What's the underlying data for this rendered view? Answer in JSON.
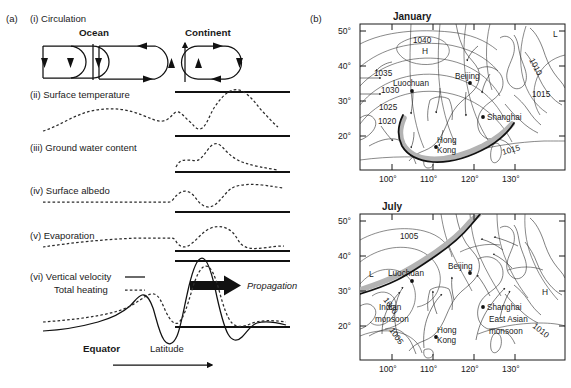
{
  "figure": {
    "panel_a_tag": "(a)",
    "panel_b_tag": "(b)"
  },
  "panel_a": {
    "rows": [
      {
        "id": "i",
        "label": "(i) Circulation"
      },
      {
        "id": "ii",
        "label": "(ii) Surface temperature"
      },
      {
        "id": "iii",
        "label": "(iii) Ground water content"
      },
      {
        "id": "iv",
        "label": "(iv) Surface albedo"
      },
      {
        "id": "v",
        "label": "(v) Evaporation"
      },
      {
        "id": "vi",
        "label": "(vi) Vertical velocity"
      },
      {
        "id": "vi_b",
        "label": "Total heating"
      }
    ],
    "circulation": {
      "ocean_label": "Ocean",
      "continent_label": "Continent"
    },
    "annotations": {
      "propagation": "Propagation",
      "equator": "Equator",
      "latitude": "Latitude"
    },
    "legend": {
      "vertical_velocity_style": "solid",
      "total_heating_style": "dashed"
    }
  },
  "panel_b": {
    "maps": [
      {
        "title": "January",
        "lat_ticks": [
          "50°",
          "40°",
          "30°",
          "20°"
        ],
        "lon_ticks": [
          "100°",
          "110°",
          "120°",
          "130°"
        ],
        "isobar_labels": [
          "1040",
          "1035",
          "1030",
          "1025",
          "1020",
          "1010",
          "1015",
          "1015"
        ],
        "pressure_centers": [
          {
            "type": "H",
            "label": "H"
          },
          {
            "type": "L",
            "label": "L"
          }
        ],
        "cities": [
          "Beijing",
          "Luochuan",
          "Shanghai",
          "Hong Kong"
        ],
        "monsoon_labels": []
      },
      {
        "title": "July",
        "lat_ticks": [
          "50°",
          "40°",
          "30°",
          "20°"
        ],
        "lon_ticks": [
          "100°",
          "110°",
          "120°",
          "130°"
        ],
        "isobar_labels": [
          "1005",
          "1000",
          "1005",
          "1010"
        ],
        "pressure_centers": [
          {
            "type": "L",
            "label": "L"
          },
          {
            "type": "H",
            "label": "H"
          }
        ],
        "cities": [
          "Beijing",
          "Luochuan",
          "Shanghai",
          "Hong Kong"
        ],
        "monsoon_labels": [
          "Indian monsoon",
          "East Asian monsoon"
        ]
      }
    ],
    "city_names": {
      "beijing": "Beijing",
      "luochuan": "Luochuan",
      "shanghai": "Shanghai",
      "hongkong_line1": "Hong",
      "hongkong_line2": "Kong"
    },
    "monsoon": {
      "indian_line1": "Indian",
      "indian_line2": "monsoon",
      "eastasian_line1": "East Asian",
      "eastasian_line2": "monsoon"
    }
  },
  "colors": {
    "ink": "#1a1a1a",
    "band_gray": "#b3b3b3",
    "coast": "#2b2b2b",
    "background": "#ffffff"
  }
}
